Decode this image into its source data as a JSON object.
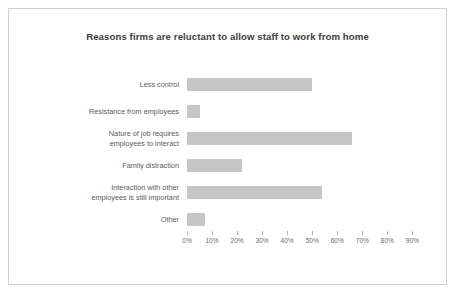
{
  "chart_data": {
    "type": "bar",
    "orientation": "horizontal",
    "title": "Reasons firms are reluctant to allow staff to work from home",
    "xlabel": "",
    "ylabel": "",
    "xlim": [
      0,
      95
    ],
    "grid": false,
    "legend": null,
    "bar_color": "#c6c6c6",
    "border_color": "#d0d0d0",
    "text_color": "#5a5a5a",
    "title_color": "#3d3d3d",
    "categories": [
      "Less control",
      "Resistance from employees",
      "Nature of job requires\nemployees to interact",
      "Family distraction",
      "Interaction with other\nemployees is still important",
      "Other"
    ],
    "values": [
      50,
      5,
      66,
      22,
      54,
      7
    ],
    "tick_labels": [
      "0%",
      "10%",
      "20%",
      "30%",
      "40%",
      "50%",
      "60%",
      "70%",
      "80%",
      "90%"
    ],
    "tick_values": [
      0,
      10,
      20,
      30,
      40,
      50,
      60,
      70,
      80,
      90
    ]
  }
}
